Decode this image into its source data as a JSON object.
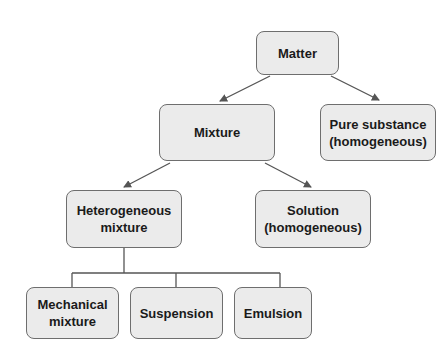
{
  "diagram": {
    "colors": {
      "box_fill": "#ebebeb",
      "box_border": "#6e6e6e",
      "line": "#555555",
      "text": "#1a1a1a"
    },
    "nodes": {
      "matter": {
        "label": "Matter"
      },
      "mixture": {
        "label": "Mixture"
      },
      "pure_substance": {
        "label": "Pure substance\n(homogeneous)"
      },
      "heterogeneous": {
        "label": "Heterogeneous\nmixture"
      },
      "solution": {
        "label": "Solution\n(homogeneous)"
      },
      "mechanical": {
        "label": "Mechanical\nmixture"
      },
      "suspension": {
        "label": "Suspension"
      },
      "emulsion": {
        "label": "Emulsion"
      }
    },
    "edges": [
      {
        "from": "Matter",
        "to": "Mixture",
        "type": "arrow"
      },
      {
        "from": "Matter",
        "to": "Pure substance (homogeneous)",
        "type": "arrow"
      },
      {
        "from": "Mixture",
        "to": "Heterogeneous mixture",
        "type": "arrow"
      },
      {
        "from": "Mixture",
        "to": "Solution (homogeneous)",
        "type": "arrow"
      },
      {
        "from": "Heterogeneous mixture",
        "to": "Mechanical mixture",
        "type": "bracket"
      },
      {
        "from": "Heterogeneous mixture",
        "to": "Suspension",
        "type": "bracket"
      },
      {
        "from": "Heterogeneous mixture",
        "to": "Emulsion",
        "type": "bracket"
      }
    ]
  }
}
